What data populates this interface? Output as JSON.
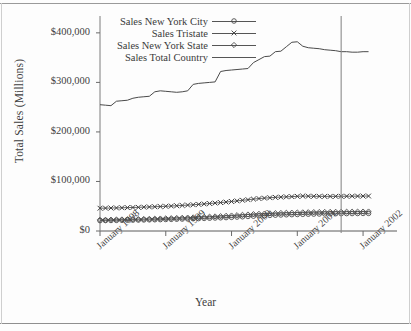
{
  "chart_data": {
    "type": "line",
    "title": "",
    "xlabel": "Year",
    "ylabel": "Total Sales (Millions)",
    "ylim": [
      0,
      430000
    ],
    "yticks": [
      0,
      100000,
      200000,
      300000,
      400000
    ],
    "ytick_labels": [
      "$0",
      "$100,000",
      "$200,000",
      "$300,000",
      "$400,000"
    ],
    "xtick_labels": [
      "January 1998",
      "January 1999",
      "January 2000",
      "January 2001",
      "January 2002"
    ],
    "xtick_values": [
      0,
      12,
      24,
      36,
      48
    ],
    "xlim": [
      0,
      52
    ],
    "grid": false,
    "legend_position": "top-center",
    "annotations": [
      {
        "type": "vertical-reference-line",
        "x": 44.0,
        "label": ""
      }
    ],
    "series": [
      {
        "name": "Sales New York City",
        "marker": "circle-open",
        "color": "#4a4a4a",
        "x": [
          0,
          1,
          2,
          3,
          4,
          5,
          6,
          7,
          8,
          9,
          10,
          11,
          12,
          13,
          14,
          15,
          16,
          17,
          18,
          19,
          20,
          21,
          22,
          23,
          24,
          25,
          26,
          27,
          28,
          29,
          30,
          31,
          32,
          33,
          34,
          35,
          36,
          37,
          38,
          39,
          40,
          41,
          42,
          43,
          44,
          45,
          46,
          47,
          48,
          49
        ],
        "values": [
          21000,
          21200,
          21300,
          21500,
          21700,
          21900,
          22000,
          22200,
          22400,
          22600,
          22800,
          23000,
          23300,
          23600,
          23900,
          24200,
          24500,
          24800,
          25100,
          25500,
          25900,
          26300,
          26700,
          27100,
          27600,
          28200,
          28800,
          29400,
          30000,
          30600,
          31100,
          31600,
          32000,
          32400,
          32800,
          33100,
          33400,
          33700,
          34000,
          34200,
          34400,
          34600,
          34800,
          35000,
          35100,
          35200,
          35300,
          35400,
          35500,
          35600
        ]
      },
      {
        "name": "Sales Tristate",
        "marker": "x-cross",
        "color": "#3d3d3d",
        "x": [
          0,
          1,
          2,
          3,
          4,
          5,
          6,
          7,
          8,
          9,
          10,
          11,
          12,
          13,
          14,
          15,
          16,
          17,
          18,
          19,
          20,
          21,
          22,
          23,
          24,
          25,
          26,
          27,
          28,
          29,
          30,
          31,
          32,
          33,
          34,
          35,
          36,
          37,
          38,
          39,
          40,
          41,
          42,
          43,
          44,
          45,
          46,
          47,
          48,
          49
        ],
        "values": [
          46000,
          46200,
          46400,
          46600,
          46900,
          47200,
          47500,
          47800,
          48200,
          48600,
          49000,
          49400,
          49900,
          50400,
          51000,
          51600,
          52300,
          53000,
          53800,
          54600,
          55500,
          56400,
          57400,
          58400,
          59600,
          60800,
          62000,
          63200,
          64400,
          65500,
          66400,
          67200,
          67900,
          68500,
          69000,
          69400,
          70000,
          70600,
          70300,
          70100,
          70000,
          69900,
          69900,
          70000,
          70100,
          70200,
          70300,
          70400,
          70500,
          70600
        ]
      },
      {
        "name": "Sales New York State",
        "marker": "diamond-open",
        "color": "#4a4a4a",
        "x": [
          0,
          1,
          2,
          3,
          4,
          5,
          6,
          7,
          8,
          9,
          10,
          11,
          12,
          13,
          14,
          15,
          16,
          17,
          18,
          19,
          20,
          21,
          22,
          23,
          24,
          25,
          26,
          27,
          28,
          29,
          30,
          31,
          32,
          33,
          34,
          35,
          36,
          37,
          38,
          39,
          40,
          41,
          42,
          43,
          44,
          45,
          46,
          47,
          48,
          49
        ],
        "values": [
          22500,
          22700,
          22900,
          23100,
          23300,
          23500,
          23700,
          23900,
          24200,
          24500,
          24800,
          25100,
          25400,
          25800,
          26200,
          26600,
          27000,
          27400,
          27900,
          28400,
          28900,
          29400,
          30000,
          30600,
          31200,
          31900,
          32600,
          33300,
          34000,
          34600,
          35100,
          35600,
          36000,
          36400,
          36700,
          37000,
          37300,
          37600,
          37900,
          38100,
          38300,
          38500,
          38600,
          38700,
          38800,
          38900,
          39000,
          39100,
          39200,
          39300
        ]
      },
      {
        "name": "Sales Total Country",
        "marker": "none",
        "color": "#4a4a4a",
        "x": [
          0,
          1,
          2,
          3,
          4,
          5,
          6,
          7,
          8,
          9,
          10,
          11,
          12,
          13,
          14,
          15,
          16,
          17,
          18,
          19,
          20,
          21,
          22,
          23,
          24,
          25,
          26,
          27,
          28,
          29,
          30,
          31,
          32,
          33,
          34,
          35,
          36,
          37,
          38,
          39,
          40,
          41,
          42,
          43,
          44,
          45,
          46,
          47,
          48,
          49
        ],
        "values": [
          255000,
          254000,
          253000,
          262000,
          263000,
          264000,
          268000,
          270000,
          271000,
          272000,
          281000,
          283000,
          282000,
          281000,
          280000,
          281000,
          283000,
          296000,
          298000,
          299000,
          300000,
          301000,
          322000,
          324000,
          325000,
          326000,
          327000,
          328000,
          340000,
          346000,
          352000,
          353000,
          362000,
          363000,
          372000,
          381000,
          382000,
          373000,
          370000,
          369000,
          368000,
          366000,
          365000,
          364000,
          362000,
          362000,
          361000,
          361000,
          362000,
          362000
        ]
      }
    ]
  },
  "legend": {
    "items": [
      {
        "label": "Sales New York City",
        "marker": "circle-open"
      },
      {
        "label": "Sales Tristate",
        "marker": "x-cross"
      },
      {
        "label": "Sales New York State",
        "marker": "diamond-open"
      },
      {
        "label": "Sales Total Country",
        "marker": "none"
      }
    ]
  }
}
